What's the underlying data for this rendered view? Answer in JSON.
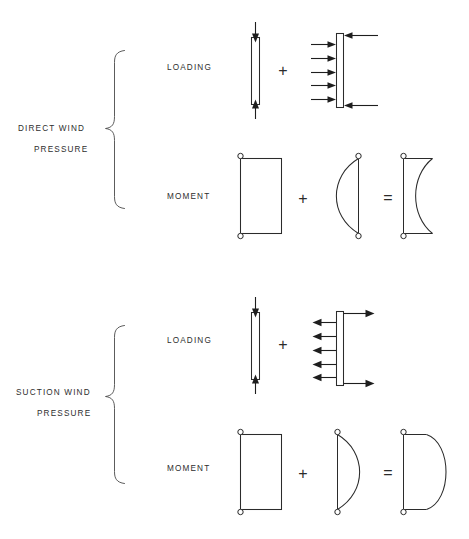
{
  "figure": {
    "title_hidden": "",
    "colors": {
      "line": "#2b2b2b",
      "arrow": "#1e1e1e",
      "brace": "#4a4a4a",
      "text": "#2e2e2e",
      "background": "#ffffff"
    },
    "sections": [
      {
        "id": "direct-wind-pressure",
        "category_label_line1": "DIRECT  WIND",
        "category_label_line2": "PRESSURE",
        "rows": [
          {
            "id": "direct-loading",
            "label": "LOADING",
            "operators": [
              "+"
            ],
            "items": [
              {
                "kind": "axial-column",
                "description": "narrow vertical member with axial compression arrows",
                "arrows": [
                  "down-top",
                  "up-bottom"
                ]
              },
              {
                "kind": "pressure-wall",
                "description": "vertical member with distributed wind pressure pushing right and end reactions pointing left",
                "distributed_arrow_count": 5,
                "distributed_direction": "right",
                "reaction_direction": "left"
              }
            ]
          },
          {
            "id": "direct-moment",
            "label": "MOMENT",
            "operators": [
              "+",
              "="
            ],
            "items": [
              {
                "kind": "rectangle-moment",
                "description": "uniform rectangular moment diagram with pinned ends"
              },
              {
                "kind": "arc-moment",
                "description": "parabolic moment lens bulging left with pinned ends",
                "bulge": "left"
              },
              {
                "kind": "combined-moment",
                "description": "combined moment diagram, concave arc bulging left",
                "bulge": "left"
              }
            ]
          }
        ]
      },
      {
        "id": "suction-wind-pressure",
        "category_label_line1": "SUCTION  WIND",
        "category_label_line2": "PRESSURE",
        "rows": [
          {
            "id": "suction-loading",
            "label": "LOADING",
            "operators": [
              "+"
            ],
            "items": [
              {
                "kind": "axial-column",
                "description": "narrow vertical member with axial compression arrows",
                "arrows": [
                  "down-top",
                  "up-bottom"
                ]
              },
              {
                "kind": "suction-wall",
                "description": "vertical member with distributed suction pulling left and end reactions pointing right",
                "distributed_arrow_count": 5,
                "distributed_direction": "left",
                "reaction_direction": "right"
              }
            ]
          },
          {
            "id": "suction-moment",
            "label": "MOMENT",
            "operators": [
              "+",
              "="
            ],
            "items": [
              {
                "kind": "rectangle-moment",
                "description": "uniform rectangular moment diagram with pinned ends"
              },
              {
                "kind": "arc-moment",
                "description": "parabolic moment lens bulging right with pinned ends",
                "bulge": "right"
              },
              {
                "kind": "combined-moment",
                "description": "combined moment diagram, convex D shape bulging right",
                "bulge": "right"
              }
            ]
          }
        ]
      }
    ],
    "operators": {
      "plus": "+",
      "equals": "="
    }
  }
}
